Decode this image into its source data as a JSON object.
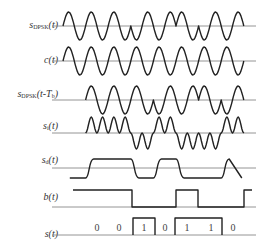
{
  "diagram": {
    "rows": [
      {
        "id": "s_dpsk",
        "label_main": "s",
        "label_sub": "DPSK",
        "label_tail": "(t)",
        "baseline_y": 26
      },
      {
        "id": "carrier",
        "label_main": "c",
        "label_sub": "",
        "label_tail": "(t)",
        "baseline_y": 61
      },
      {
        "id": "s_dpsk_delayed",
        "label_main": "s",
        "label_sub": "DPSK",
        "label_tail": "(t-T",
        "label_tail_sub": "b",
        "label_tail_end": ")",
        "baseline_y": 100
      },
      {
        "id": "s_i",
        "label_main": "s",
        "label_sub": "i",
        "label_tail": "(t)",
        "baseline_y": 133
      },
      {
        "id": "s_d",
        "label_main": "s",
        "label_sub": "d",
        "label_tail": "(t)",
        "baseline_y": 168
      },
      {
        "id": "b",
        "label_main": "b",
        "label_sub": "",
        "label_tail": "(t)",
        "baseline_y": 207
      },
      {
        "id": "s",
        "label_main": "s",
        "label_sub": "",
        "label_tail": "(t)",
        "baseline_y": 235
      }
    ],
    "bits": [
      "0",
      "0",
      "1",
      "0",
      "1",
      "1",
      "0"
    ],
    "colors": {
      "waveform": "#222222",
      "baseline": "#888888",
      "text": "#333333"
    }
  }
}
